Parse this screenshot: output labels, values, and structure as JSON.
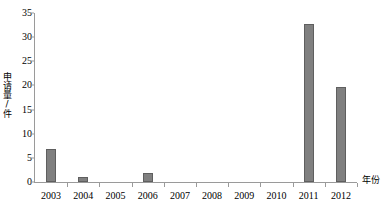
{
  "chart_data": {
    "type": "bar",
    "title": "",
    "subtitle": "",
    "xlabel": "年份",
    "ylabel": "申请量/件",
    "categories": [
      "2003",
      "2004",
      "2005",
      "2006",
      "2007",
      "2008",
      "2009",
      "2010",
      "2011",
      "2012"
    ],
    "values": [
      6.8,
      1.0,
      0,
      1.8,
      0,
      0,
      0,
      0,
      32.7,
      19.7
    ],
    "series": [
      {
        "name": "申请量",
        "values": [
          6.8,
          1.0,
          0,
          1.8,
          0,
          0,
          0,
          0,
          32.7,
          19.7
        ]
      }
    ],
    "ylim": [
      0,
      35
    ],
    "ytick_step": 5,
    "yticks": [
      0,
      5,
      10,
      15,
      20,
      25,
      30,
      35
    ],
    "ytick_labels": [
      "0",
      "5",
      "10",
      "15",
      "20",
      "25",
      "30",
      "35"
    ],
    "grid": false,
    "legend": "none",
    "bar_color": "#808080",
    "bar_border_color": "#5f5f5f",
    "axis_color": "#9a9a9a",
    "background_color": "#ffffff"
  }
}
